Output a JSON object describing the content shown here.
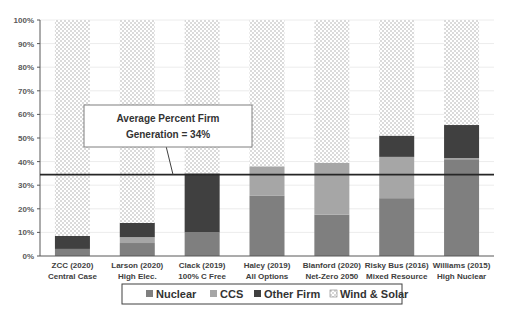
{
  "chart_data": {
    "type": "bar",
    "stacked": true,
    "title": "",
    "xlabel": "",
    "ylabel": "",
    "ylim": [
      0,
      100
    ],
    "y_ticks": [
      "0%",
      "10%",
      "20%",
      "30%",
      "40%",
      "50%",
      "60%",
      "70%",
      "80%",
      "90%",
      "100%"
    ],
    "categories": [
      [
        "ZCC (2020)",
        "Central Case"
      ],
      [
        "Larson (2020)",
        "High Elec."
      ],
      [
        "Clack (2019)",
        "100% C Free"
      ],
      [
        "Haley (2019)",
        "All Options"
      ],
      [
        "Blanford (2020)",
        "Net-Zero 2050"
      ],
      [
        "Risky Bus (2016)",
        "Mixed Resource"
      ],
      [
        "Williams (2015)",
        "High Nuclear"
      ]
    ],
    "series": [
      {
        "name": "Nuclear",
        "color": "#7f7f7f",
        "values": [
          3,
          5.5,
          10,
          25.5,
          17.5,
          24.5,
          41
        ]
      },
      {
        "name": "CCS",
        "color": "#a6a6a6",
        "values": [
          0,
          2.5,
          0,
          12.5,
          22,
          17.5,
          0.5
        ]
      },
      {
        "name": "Other Firm",
        "color": "#404040",
        "values": [
          5.5,
          6,
          25,
          0,
          0,
          9,
          14
        ]
      },
      {
        "name": "Wind & Solar",
        "color": "pattern-dots",
        "values": [
          91.5,
          86,
          65,
          62,
          60.5,
          49,
          44.5
        ]
      }
    ],
    "reference_line": {
      "value": 34.5,
      "label": "Average Percent Firm Generation = 34%"
    },
    "annotation": {
      "line1": "Average Percent Firm",
      "line2": "Generation = 34%"
    },
    "legend": {
      "position": "bottom",
      "items": [
        "Nuclear",
        "CCS",
        "Other Firm",
        "Wind & Solar"
      ]
    },
    "grid": true
  }
}
